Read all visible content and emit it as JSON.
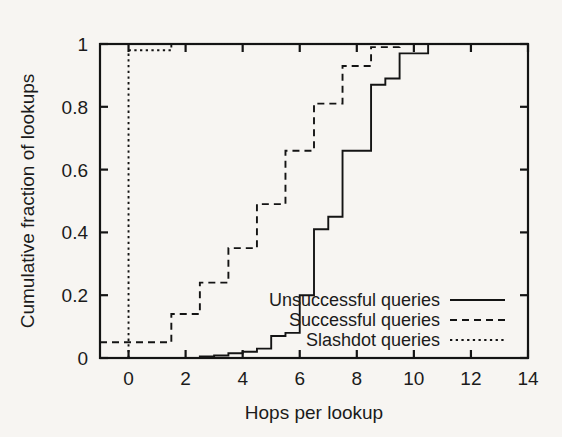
{
  "chart_data": {
    "type": "line",
    "title": "",
    "xlabel": "Hops per lookup",
    "ylabel": "Cumulative fraction of lookups",
    "xlim": [
      -1,
      14
    ],
    "ylim": [
      0,
      1
    ],
    "xticks": [
      0,
      2,
      4,
      6,
      8,
      10,
      12,
      14
    ],
    "xtick_labels": [
      "0",
      "2",
      "4",
      "6",
      "8",
      "10",
      "12",
      "14"
    ],
    "yticks": [
      0,
      0.2,
      0.4,
      0.6,
      0.8,
      1
    ],
    "ytick_labels": [
      "0",
      "0.2",
      "0.4",
      "0.6",
      "0.8",
      "1"
    ],
    "grid": false,
    "legend_position": "lower-right-inside",
    "drawstyle": "steps-post",
    "series": [
      {
        "name": "Unsuccessful queries",
        "style": "solid",
        "color": "#141414",
        "x": [
          -1,
          2,
          2.5,
          3,
          3.5,
          4,
          4.5,
          5,
          5.5,
          6,
          6.5,
          7,
          7.5,
          8,
          8.5,
          9,
          9.5,
          10,
          10.5,
          14
        ],
        "y": [
          0,
          0,
          0.005,
          0.008,
          0.015,
          0.02,
          0.03,
          0.07,
          0.08,
          0.2,
          0.41,
          0.45,
          0.66,
          0.66,
          0.87,
          0.89,
          0.97,
          0.97,
          1,
          1
        ]
      },
      {
        "name": "Successful queries",
        "style": "dashed",
        "color": "#141414",
        "x": [
          -1,
          0,
          1,
          1.5,
          2,
          2.5,
          3,
          3.5,
          4,
          4.5,
          5,
          5.5,
          6,
          6.5,
          7,
          7.5,
          8,
          8.5,
          9,
          9.5,
          10,
          14
        ],
        "y": [
          0.05,
          0.05,
          0.05,
          0.14,
          0.14,
          0.24,
          0.24,
          0.35,
          0.35,
          0.49,
          0.49,
          0.66,
          0.66,
          0.81,
          0.81,
          0.93,
          0.93,
          0.99,
          0.99,
          1,
          1,
          1
        ]
      },
      {
        "name": "Slashdot queries",
        "style": "dotted",
        "color": "#141414",
        "x": [
          0,
          0,
          1,
          1.5,
          14
        ],
        "y": [
          0,
          0.98,
          0.98,
          1,
          1
        ]
      }
    ],
    "legend": [
      {
        "label": "Unsuccessful queries",
        "style": "solid"
      },
      {
        "label": "Successful queries",
        "style": "dashed"
      },
      {
        "label": "Slashdot queries",
        "style": "dotted"
      }
    ]
  }
}
